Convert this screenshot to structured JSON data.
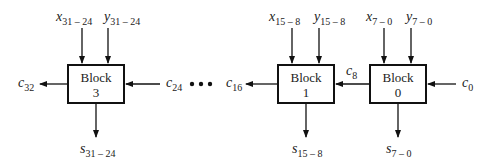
{
  "diagram": {
    "blocks": [
      {
        "label": "Block",
        "number": "3",
        "x_in": {
          "base": "x",
          "sub": "31 – 24"
        },
        "y_in": {
          "base": "y",
          "sub": "31 – 24"
        },
        "sum_out": {
          "base": "s",
          "sub": "31 – 24"
        }
      },
      {
        "label": "Block",
        "number": "1",
        "x_in": {
          "base": "x",
          "sub": "15 – 8"
        },
        "y_in": {
          "base": "y",
          "sub": "15 – 8"
        },
        "sum_out": {
          "base": "s",
          "sub": "15 – 8"
        }
      },
      {
        "label": "Block",
        "number": "0",
        "x_in": {
          "base": "x",
          "sub": "7 – 0"
        },
        "y_in": {
          "base": "y",
          "sub": "7 – 0"
        },
        "sum_out": {
          "base": "s",
          "sub": "7 – 0"
        }
      }
    ],
    "carries": {
      "c32": {
        "base": "c",
        "sub": "32"
      },
      "c24": {
        "base": "c",
        "sub": "24"
      },
      "c16": {
        "base": "c",
        "sub": "16"
      },
      "c8": {
        "base": "c",
        "sub": "8"
      },
      "c0": {
        "base": "c",
        "sub": "0"
      }
    },
    "ellipsis": "• • •"
  }
}
